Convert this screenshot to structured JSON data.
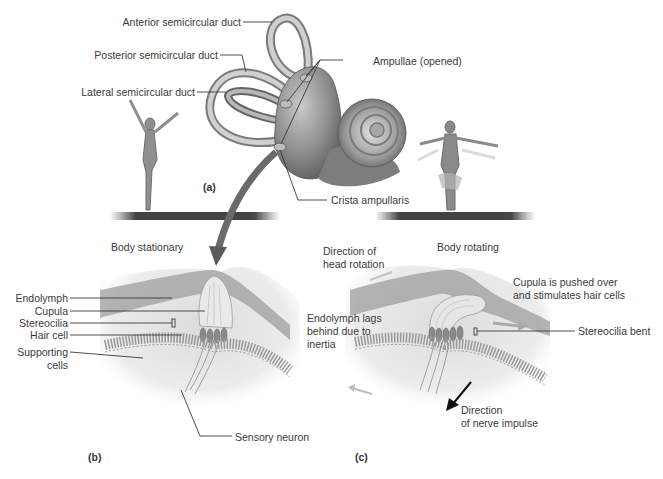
{
  "figure": {
    "palette": {
      "background": "#ffffff",
      "tissue_dark": "#6b6b6b",
      "tissue_mid": "#9a9a9a",
      "tissue_light": "#d6d6d6",
      "line": "#3a3a3a",
      "text": "#3a3a3a"
    }
  },
  "panel_a": {
    "tag": "(a)",
    "labels": {
      "anterior_duct": "Anterior semicircular duct",
      "posterior_duct": "Posterior semicircular duct",
      "lateral_duct": "Lateral semicircular duct",
      "ampullae": "Ampullae (opened)",
      "crista": "Crista ampullaris"
    }
  },
  "panel_b": {
    "tag": "(b)",
    "caption": "Body stationary",
    "labels": {
      "endolymph": "Endolymph",
      "cupula": "Cupula",
      "stereocilia": "Stereocilia",
      "hair_cell": "Hair cell",
      "supporting_cells_line1": "Supporting",
      "supporting_cells_line2": "cells",
      "sensory_neuron": "Sensory neuron"
    }
  },
  "panel_c": {
    "tag": "(c)",
    "caption": "Body rotating",
    "labels": {
      "head_rotation_line1": "Direction of",
      "head_rotation_line2": "head rotation",
      "cupula_pushed_line1": "Cupula is pushed over",
      "cupula_pushed_line2": "and stimulates hair cells",
      "endolymph_lags_line1": "Endolymph lags",
      "endolymph_lags_line2": "behind due to",
      "endolymph_lags_line3": "inertia",
      "stereocilia_bent": "Stereocilia bent",
      "nerve_impulse_line1": "Direction",
      "nerve_impulse_line2": "of nerve impulse"
    }
  }
}
